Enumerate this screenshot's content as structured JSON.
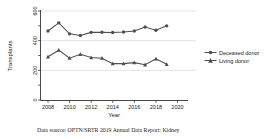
{
  "chart_data": {
    "type": "line",
    "title": "",
    "xlabel": "Year",
    "ylabel": "Transplants",
    "x": [
      2008,
      2009,
      2010,
      2011,
      2012,
      2013,
      2014,
      2015,
      2016,
      2017,
      2018,
      2019
    ],
    "series": [
      {
        "name": "Deceased donor",
        "marker": "circle",
        "values": [
          465,
          520,
          446,
          435,
          456,
          457,
          455,
          458,
          465,
          492,
          470,
          500
        ]
      },
      {
        "name": "Living donor",
        "marker": "triangle",
        "values": [
          291,
          336,
          282,
          308,
          286,
          282,
          245,
          245,
          252,
          238,
          278,
          241
        ]
      }
    ],
    "xlim": [
      2007.5,
      2020.5
    ],
    "ylim": [
      0,
      600
    ],
    "x_ticks": [
      2008,
      2010,
      2012,
      2014,
      2016,
      2018,
      2020
    ],
    "y_tick_labels": [
      0,
      200,
      400,
      600
    ],
    "y_minor_step": 100,
    "grid_values": [
      200,
      400,
      600
    ],
    "grid_on": true,
    "legend_position": "right",
    "line_color": "#4f4f4f",
    "axis_color": "#333333",
    "grid_color": "#dcdcdc",
    "text_color": "#1a1a1a"
  },
  "caption": "Data source: OPTN/SRTR 2019 Annual Data Report: Kidney"
}
